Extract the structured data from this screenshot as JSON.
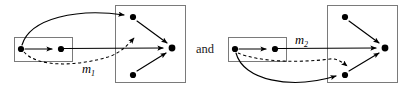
{
  "figure": {
    "width": 403,
    "height": 91,
    "background": "#ffffff",
    "ink_color": "#000000",
    "box_stroke_color": "#7a7a7a",
    "conjunction_label": "and",
    "diagrams": [
      {
        "id": "left-diagram",
        "map_label": "m",
        "map_subscript": "1",
        "source_box": {
          "x": 14,
          "y": 37,
          "width": 58,
          "height": 24,
          "nodes": [
            {
              "id": "L-s1",
              "cx": 21,
              "cy": 49
            },
            {
              "id": "L-s2",
              "cx": 61,
              "cy": 49
            }
          ],
          "internal_edge": {
            "from": "L-s1",
            "to": "L-s2",
            "style": "solid"
          }
        },
        "target_box": {
          "x": 115,
          "y": 5,
          "width": 70,
          "height": 78,
          "nodes": [
            {
              "id": "L-t1",
              "cx": 133,
              "cy": 17
            },
            {
              "id": "L-t2",
              "cx": 172,
              "cy": 48
            },
            {
              "id": "L-t3",
              "cx": 133,
              "cy": 75
            }
          ],
          "internal_edges": [
            {
              "from": "L-t1",
              "to": "L-t2",
              "style": "solid"
            },
            {
              "from": "L-t3",
              "to": "L-t2",
              "style": "solid"
            }
          ]
        },
        "cross_edges": [
          {
            "from": "L-s1",
            "to": "L-t1",
            "style": "solid-curve",
            "curve": "up"
          },
          {
            "from": "L-s2",
            "to": "L-t2",
            "style": "solid-straight"
          },
          {
            "from": "L-s1",
            "to": "L-mid",
            "style": "dashed-curve",
            "label": "m1"
          }
        ]
      },
      {
        "id": "right-diagram",
        "map_label": "m",
        "map_subscript": "2",
        "source_box": {
          "x": 228,
          "y": 37,
          "width": 58,
          "height": 24,
          "nodes": [
            {
              "id": "R-s1",
              "cx": 235,
              "cy": 49
            },
            {
              "id": "R-s2",
              "cx": 275,
              "cy": 49
            }
          ],
          "internal_edge": {
            "from": "R-s1",
            "to": "R-s2",
            "style": "solid"
          }
        },
        "target_box": {
          "x": 327,
          "y": 5,
          "width": 70,
          "height": 78,
          "nodes": [
            {
              "id": "R-t1",
              "cx": 345,
              "cy": 17
            },
            {
              "id": "R-t2",
              "cx": 385,
              "cy": 48
            },
            {
              "id": "R-t3",
              "cx": 345,
              "cy": 75
            }
          ],
          "internal_edges": [
            {
              "from": "R-t1",
              "to": "R-t2",
              "style": "solid"
            },
            {
              "from": "R-t3",
              "to": "R-t2",
              "style": "solid"
            }
          ]
        },
        "cross_edges": [
          {
            "from": "R-s2",
            "to": "R-t2",
            "style": "solid-straight"
          },
          {
            "from": "R-s1",
            "to": "R-t3",
            "style": "solid-curve",
            "curve": "down"
          },
          {
            "from": "R-s1",
            "to": "R-mid",
            "style": "dashed-curve",
            "label": "m2"
          }
        ]
      }
    ]
  }
}
